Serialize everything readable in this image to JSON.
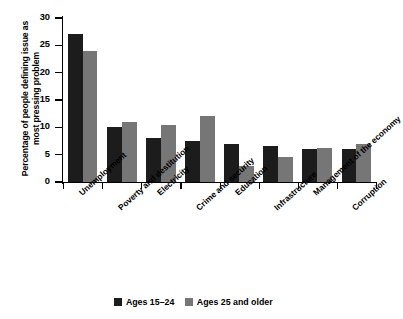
{
  "chart_data": {
    "type": "bar",
    "title": "",
    "subtitle": "",
    "xlabel": "",
    "ylabel": "Percentage of people defining issue as most pressing problem",
    "ylim": [
      0,
      30
    ],
    "yticks": [
      0,
      5,
      10,
      15,
      20,
      25,
      30
    ],
    "ytick_labels": [
      "0",
      "5",
      "10",
      "15",
      "20",
      "25",
      "30"
    ],
    "grid": false,
    "legend_position": "bottom",
    "categories": [
      "Unemployment",
      "Poverty and destitution",
      "Electricity",
      "Crime and security",
      "Education",
      "Infrastructure",
      "Management of the economy",
      "Corruption"
    ],
    "series": [
      {
        "name": "Ages 15–24",
        "color": "#1c1c1c",
        "values": [
          27,
          10,
          8,
          7.5,
          7,
          6.5,
          6,
          6
        ]
      },
      {
        "name": "Ages 25 and older",
        "color": "#767676",
        "values": [
          24,
          11,
          10.5,
          12,
          3,
          4.5,
          6.3,
          7
        ]
      }
    ]
  },
  "legend": {
    "items": [
      {
        "label": "Ages 15–24",
        "color": "#1c1c1c"
      },
      {
        "label": "Ages 25 and older",
        "color": "#767676"
      }
    ]
  },
  "colors": {
    "series_young": "#1c1c1c",
    "series_older": "#767676",
    "axis": "#000000",
    "background": "#ffffff"
  }
}
